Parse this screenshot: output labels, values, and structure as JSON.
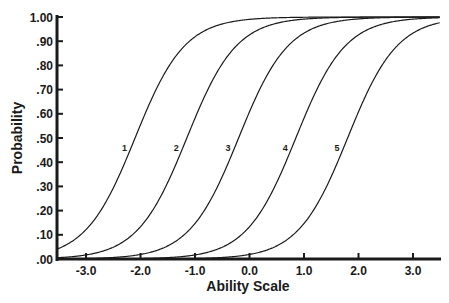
{
  "chart_data": {
    "type": "line",
    "title": "",
    "xlabel": "Ability Scale",
    "ylabel": "Probability",
    "xlim": [
      -3.53,
      3.5
    ],
    "ylim": [
      0,
      1
    ],
    "grid": false,
    "legend": "inline curve labels",
    "x_ticks": [
      "-3.0",
      "-2.0",
      "-1.0",
      "0.0",
      "1.0",
      "2.0",
      "3.0"
    ],
    "x_tick_values": [
      -3,
      -2,
      -1,
      0,
      1,
      2,
      3
    ],
    "y_ticks": [
      ".00",
      ".10",
      ".20",
      ".30",
      ".40",
      ".50",
      ".60",
      ".70",
      ".80",
      ".90",
      "1.00"
    ],
    "y_tick_values": [
      0,
      0.1,
      0.2,
      0.3,
      0.4,
      0.5,
      0.6,
      0.7,
      0.8,
      0.9,
      1.0
    ],
    "curve_model": "logistic p = 1/(1+exp(-slope*(theta-b)))",
    "slope": 2.2,
    "series": [
      {
        "name": "1",
        "b": -2.1
      },
      {
        "name": "2",
        "b": -1.15
      },
      {
        "name": "3",
        "b": -0.2
      },
      {
        "name": "4",
        "b": 0.85
      },
      {
        "name": "5",
        "b": 1.8
      }
    ],
    "label_y_probability": 0.46
  },
  "colors": {
    "ink": "#1a1a1a",
    "background": "#ffffff"
  }
}
